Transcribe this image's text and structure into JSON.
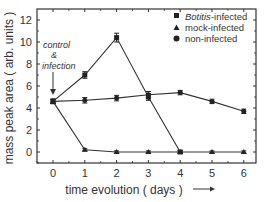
{
  "chart_data": {
    "type": "line",
    "title": "",
    "xlabel": "time evolution  ( days )",
    "ylabel": "mass peak area  ( arb. units )",
    "x": [
      0,
      1,
      2,
      3,
      4,
      5,
      6
    ],
    "xticks": [
      "0",
      "1",
      "2",
      "3",
      "4",
      "5",
      "6"
    ],
    "yticks": [
      "0",
      "2",
      "4",
      "6",
      "8",
      "10",
      "12"
    ],
    "xlim": [
      -0.5,
      6.4
    ],
    "ylim": [
      -1,
      13
    ],
    "grid": false,
    "legend_position": "top-right",
    "series": [
      {
        "name": "Botitis-infected",
        "marker": "square",
        "values": [
          4.6,
          7.0,
          10.4,
          5.0,
          0.0,
          null,
          null
        ],
        "errors": [
          0.2,
          0.3,
          0.4,
          0.3,
          0.1,
          null,
          null
        ]
      },
      {
        "name": "mock-infected",
        "marker": "triangle",
        "values": [
          4.6,
          0.2,
          0.0,
          0.0,
          0.0,
          0.0,
          0.0
        ],
        "errors": [
          0.2,
          0.1,
          0.1,
          0.1,
          0.1,
          0.1,
          0.1
        ]
      },
      {
        "name": "non-infected",
        "marker": "circle",
        "values": [
          4.6,
          4.7,
          4.9,
          5.2,
          5.4,
          4.6,
          3.7
        ],
        "errors": [
          0.2,
          0.25,
          0.25,
          0.3,
          0.2,
          0.2,
          0.2
        ]
      }
    ],
    "annotations": [
      {
        "text": "control",
        "x": 0,
        "y": 9.2
      },
      {
        "text": "&",
        "x": 0,
        "y": 8.2
      },
      {
        "text": "infection",
        "x": 0,
        "y": 7.2
      }
    ]
  },
  "legend": {
    "items": [
      {
        "label_italic": "Botitis",
        "label_rest": "-infected"
      },
      {
        "label": "mock-infected"
      },
      {
        "label": "non-infected"
      }
    ]
  },
  "annotation": {
    "line1": "control",
    "line2": "&",
    "line3": "infection"
  },
  "axes": {
    "xlabel": "time evolution  ( days )",
    "ylabel": "mass peak area  ( arb. units )"
  }
}
